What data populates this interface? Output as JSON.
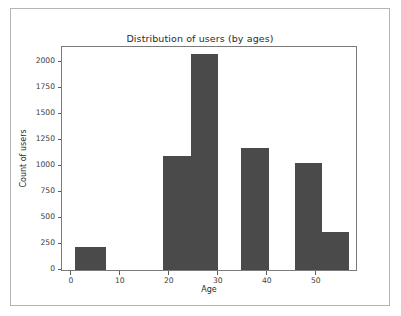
{
  "chart_data": {
    "type": "bar",
    "title": "Distribution of users (by ages)",
    "xlabel": "Age",
    "ylabel": "Count of users",
    "xlim": [
      -2,
      58
    ],
    "ylim": [
      0,
      2150
    ],
    "grid": false,
    "legend": null,
    "bin_width": 7,
    "bar_color": "#4a4a4a",
    "categories": [
      "0-7",
      "7-14",
      "14-21",
      "21-28",
      "28-35",
      "35-42",
      "42-49",
      "49-56"
    ],
    "bin_edges": [
      0,
      7,
      14,
      21,
      28,
      35,
      42,
      49,
      56
    ],
    "values": [
      220,
      0,
      1100,
      2080,
      0,
      1180,
      1030,
      370
    ],
    "bars": [
      {
        "x0": 0.6,
        "x1": 7.0,
        "value": 220
      },
      {
        "x0": 18.7,
        "x1": 24.3,
        "value": 1100
      },
      {
        "x0": 24.3,
        "x1": 29.8,
        "value": 2080
      },
      {
        "x0": 34.6,
        "x1": 40.2,
        "value": 1180
      },
      {
        "x0": 45.6,
        "x1": 51.1,
        "value": 1030
      },
      {
        "x0": 51.1,
        "x1": 56.6,
        "value": 370
      }
    ],
    "yticks": [
      0,
      250,
      500,
      750,
      1000,
      1250,
      1500,
      1750,
      2000
    ],
    "ytick_labels": [
      "0",
      "250",
      "500",
      "750",
      "1000",
      "1250",
      "1500",
      "1750",
      "2000"
    ],
    "xticks": [
      0,
      10,
      20,
      30,
      40,
      50
    ],
    "xtick_labels": [
      "0",
      "10",
      "20",
      "30",
      "40",
      "50"
    ]
  }
}
